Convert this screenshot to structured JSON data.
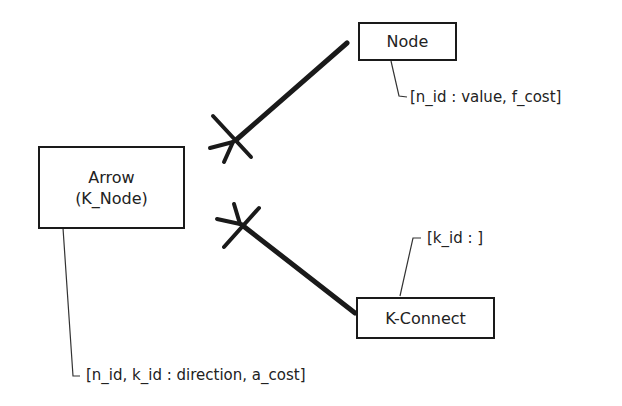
{
  "entities": {
    "arrow": {
      "line1": "Arrow",
      "line2": "(K_Node)"
    },
    "node": {
      "label": "Node"
    },
    "kconnect": {
      "label": "K-Connect"
    }
  },
  "annotations": {
    "node_attrs": "[n_id : value, f_cost]",
    "kconnect_attrs": "[k_id : ]",
    "arrow_attrs": "[n_id, k_id : direction, a_cost]"
  },
  "relationships": [
    {
      "from": "Arrow",
      "to": "Node",
      "arrow_end": "many-mandatory (crow's foot + bar)",
      "other_end": "none"
    },
    {
      "from": "Arrow",
      "to": "K-Connect",
      "arrow_end": "many-mandatory (crow's foot + bar)",
      "other_end": "none"
    }
  ],
  "colors": {
    "stroke": "#1a1a1a",
    "background": "#ffffff"
  }
}
